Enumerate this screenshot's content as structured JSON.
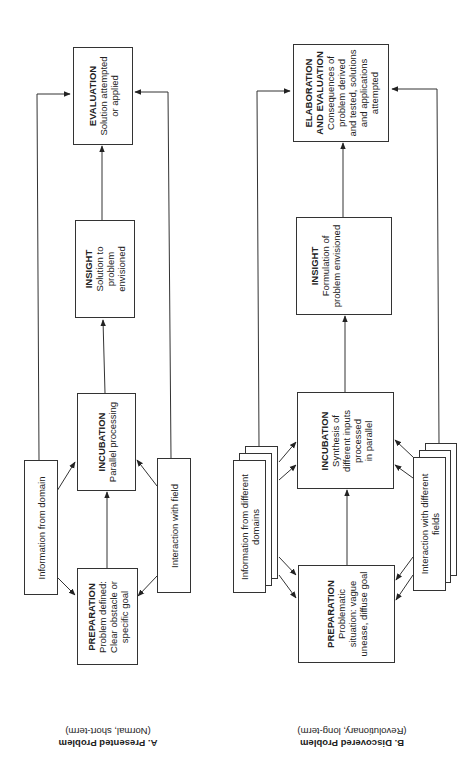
{
  "diagram_a": {
    "caption_title": "A. Presented Problem",
    "caption_subtitle": "(Normal, short-term)",
    "preparation": {
      "title": "PREPARATION",
      "lines": [
        "Problem defined:",
        "Clear obstacle or",
        "specific goal"
      ]
    },
    "incubation": {
      "title": "INCUBATION",
      "lines": [
        "Parallel processing"
      ]
    },
    "insight": {
      "title": "INSIGHT",
      "lines": [
        "Solution to",
        "problem",
        "envisioned"
      ]
    },
    "evaluation": {
      "title": "EVALUATION",
      "lines": [
        "Solution attempted",
        "or applied"
      ]
    },
    "input_left": {
      "lines": [
        "Information from domain"
      ]
    },
    "input_right": {
      "lines": [
        "Interaction with field"
      ]
    }
  },
  "diagram_b": {
    "caption_title": "B. Discovered Problem",
    "caption_subtitle": "(Revolutionary, long-term)",
    "preparation": {
      "title": "PREPARATION",
      "lines": [
        "Problematic",
        "situation: vague",
        "unease, diffuse goal"
      ]
    },
    "incubation": {
      "title": "INCUBATION",
      "lines": [
        "Synthesis of",
        "different inputs",
        "processed",
        "in parallel"
      ]
    },
    "insight": {
      "title": "INSIGHT",
      "lines": [
        "Formulation of",
        "problem envisioned"
      ]
    },
    "evaluation": {
      "title": "ELABORATION",
      "title2": "AND EVALUATION",
      "lines": [
        "Consequences of",
        "problem derived",
        "and tested, solutions",
        "and applications",
        "attempted"
      ]
    },
    "input_left": {
      "lines": [
        "Information from different",
        "domains"
      ]
    },
    "input_right": {
      "lines": [
        "Interaction with different",
        "fields"
      ]
    }
  }
}
